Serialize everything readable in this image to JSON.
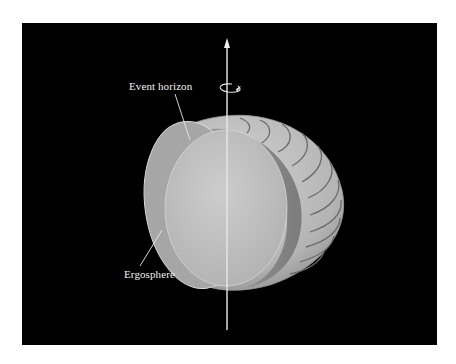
{
  "figure": {
    "labels": {
      "event_horizon": "Event horizon",
      "ergosphere": "Ergosphere"
    },
    "elements": {
      "rotation_axis": "rotation-axis-arrow",
      "rotation_indicator": "circular-rotation-arrow"
    },
    "colors": {
      "background": "#000000",
      "page": "#ffffff",
      "ergosphere_outer": "#b8b8b8",
      "ergosphere_cut": "#8c8c8c",
      "event_horizon": "#c8c8c8",
      "stripe": "#6e6e6e",
      "axis": "#e8e8e8",
      "label_text": "#f2f2f2"
    }
  }
}
